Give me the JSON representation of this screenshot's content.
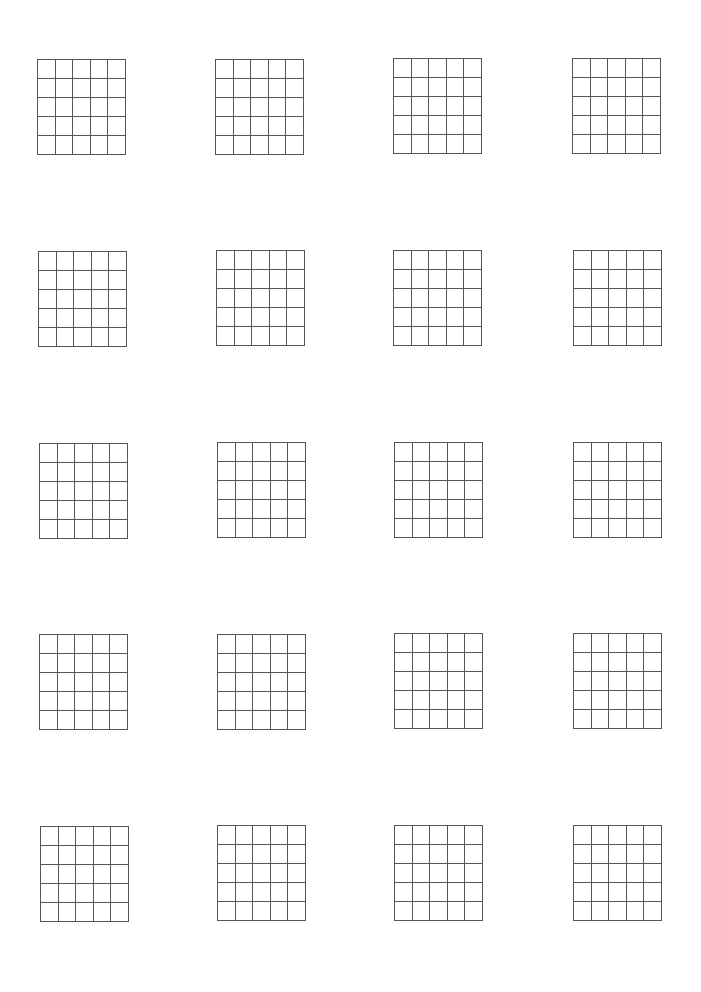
{
  "page": {
    "background": "#ffffff",
    "line_color": "#555555"
  },
  "grid_spec": {
    "columns": 5,
    "rows": 5,
    "width": 89,
    "height": 96
  },
  "grids": [
    {
      "row": 1,
      "col": 1,
      "x": 37,
      "y": 59
    },
    {
      "row": 1,
      "col": 2,
      "x": 215,
      "y": 59
    },
    {
      "row": 1,
      "col": 3,
      "x": 393,
      "y": 58
    },
    {
      "row": 1,
      "col": 4,
      "x": 572,
      "y": 58
    },
    {
      "row": 2,
      "col": 1,
      "x": 38,
      "y": 251
    },
    {
      "row": 2,
      "col": 2,
      "x": 216,
      "y": 250
    },
    {
      "row": 2,
      "col": 3,
      "x": 393,
      "y": 250
    },
    {
      "row": 2,
      "col": 4,
      "x": 573,
      "y": 250
    },
    {
      "row": 3,
      "col": 1,
      "x": 39,
      "y": 443
    },
    {
      "row": 3,
      "col": 2,
      "x": 217,
      "y": 442
    },
    {
      "row": 3,
      "col": 3,
      "x": 394,
      "y": 442
    },
    {
      "row": 3,
      "col": 4,
      "x": 573,
      "y": 442
    },
    {
      "row": 4,
      "col": 1,
      "x": 39,
      "y": 634
    },
    {
      "row": 4,
      "col": 2,
      "x": 217,
      "y": 634
    },
    {
      "row": 4,
      "col": 3,
      "x": 394,
      "y": 633
    },
    {
      "row": 4,
      "col": 4,
      "x": 573,
      "y": 633
    },
    {
      "row": 5,
      "col": 1,
      "x": 40,
      "y": 826
    },
    {
      "row": 5,
      "col": 2,
      "x": 217,
      "y": 825
    },
    {
      "row": 5,
      "col": 3,
      "x": 394,
      "y": 825
    },
    {
      "row": 5,
      "col": 4,
      "x": 573,
      "y": 825
    }
  ]
}
